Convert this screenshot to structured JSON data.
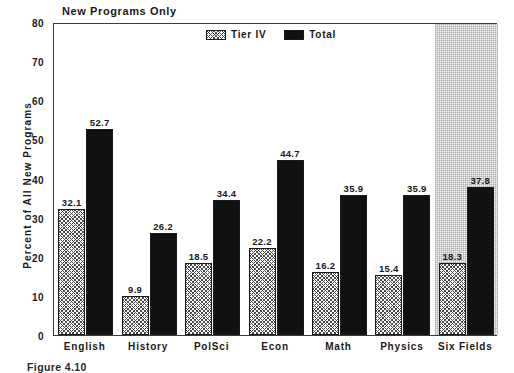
{
  "figure": {
    "caption": "Figure 4.10"
  },
  "chart_data": {
    "type": "bar",
    "title": "New Programs Only",
    "xlabel": "",
    "ylabel": "Percent of All New Programs",
    "ylim": [
      0,
      80
    ],
    "ytick_step": 10,
    "yticks": [
      "0",
      "10",
      "20",
      "30",
      "40",
      "50",
      "60",
      "70",
      "80"
    ],
    "grid": false,
    "legend_position": "top-center",
    "categories": [
      "English",
      "History",
      "PolSci",
      "Econ",
      "Math",
      "Physics",
      "Six Fields"
    ],
    "series": [
      {
        "name": "Tier IV",
        "fill": "hatch",
        "color": "#4a4a4a",
        "values": [
          32.1,
          9.9,
          18.5,
          22.2,
          16.2,
          15.4,
          18.3
        ],
        "labels": [
          "32.1",
          "9.9",
          "18.5",
          "22.2",
          "16.2",
          "15.4",
          "18.3"
        ]
      },
      {
        "name": "Total",
        "fill": "solid",
        "color": "#111111",
        "values": [
          52.7,
          26.2,
          34.4,
          44.7,
          35.9,
          35.9,
          37.8
        ],
        "labels": [
          "52.7",
          "26.2",
          "34.4",
          "44.7",
          "35.9",
          "35.9",
          "37.8"
        ]
      }
    ],
    "highlight_region": {
      "category": "Six Fields",
      "color": "#f2f2f2"
    }
  }
}
